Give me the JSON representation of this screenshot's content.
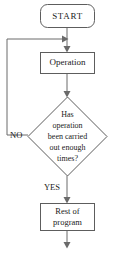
{
  "diagram": {
    "type": "flowchart",
    "colors": {
      "background": "#ffffff",
      "shape_fill": "#ffffff",
      "shape_stroke": "#5d5d5d",
      "connector": "#6a6a6a",
      "text": "#1a1a1a"
    },
    "nodes": {
      "start": {
        "shape": "terminator",
        "label": "START"
      },
      "operation": {
        "shape": "process",
        "label": "Operation"
      },
      "decision": {
        "shape": "diamond",
        "lines": [
          "Has",
          "operation",
          "been carried",
          "out enough",
          "times?"
        ]
      },
      "rest": {
        "shape": "process",
        "lines": [
          "Rest of",
          "program"
        ]
      }
    },
    "edge_labels": {
      "no": "NO",
      "yes": "YES"
    }
  }
}
